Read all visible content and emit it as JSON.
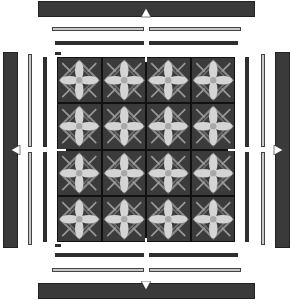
{
  "diagram": {
    "type": "exploded-view",
    "grid": {
      "rows": 4,
      "cols": 4,
      "tile_pattern": "quatrefoil-diamond"
    },
    "layers_per_side": 3,
    "arrows": [
      "up",
      "down",
      "left",
      "right"
    ],
    "colors": {
      "dark_bar": "#3a3a3a",
      "light_bar": "#c8c8c8",
      "tile_bg": "#3b3b3b",
      "tile_petal": "#d4d4d4",
      "grid_gap": "#111111",
      "arrow": "#ffffff"
    }
  }
}
